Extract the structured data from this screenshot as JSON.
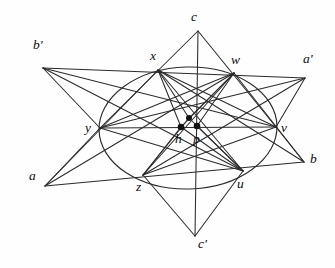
{
  "figure": {
    "background_color": "#fefefe",
    "stroke_color": "#2b2b2b",
    "width": 335,
    "height": 268
  },
  "labels": [
    {
      "id": "b-prime",
      "text": "b'",
      "x": 33,
      "y": 38,
      "kind": "outer-vertex"
    },
    {
      "id": "c",
      "text": "c",
      "x": 191,
      "y": 10,
      "kind": "outer-vertex"
    },
    {
      "id": "a-prime",
      "text": "a'",
      "x": 303,
      "y": 52,
      "kind": "outer-vertex"
    },
    {
      "id": "x",
      "text": "x",
      "x": 150,
      "y": 49,
      "kind": "conic-point"
    },
    {
      "id": "w",
      "text": "w",
      "x": 231,
      "y": 53,
      "kind": "conic-point"
    },
    {
      "id": "y",
      "text": "y",
      "x": 85,
      "y": 121,
      "kind": "conic-point"
    },
    {
      "id": "v",
      "text": "v",
      "x": 281,
      "y": 121,
      "kind": "conic-point"
    },
    {
      "id": "h",
      "text": "h",
      "x": 175,
      "y": 132,
      "kind": "center-point"
    },
    {
      "id": "p",
      "text": "p",
      "x": 193,
      "y": 132,
      "kind": "center-point"
    },
    {
      "id": "a",
      "text": "a",
      "x": 29,
      "y": 169,
      "kind": "outer-vertex"
    },
    {
      "id": "b",
      "text": "b",
      "x": 310,
      "y": 152,
      "kind": "outer-vertex"
    },
    {
      "id": "z",
      "text": "z",
      "x": 136,
      "y": 180,
      "kind": "conic-point"
    },
    {
      "id": "u",
      "text": "u",
      "x": 237,
      "y": 177,
      "kind": "conic-point"
    },
    {
      "id": "c-prime",
      "text": "c'",
      "x": 198,
      "y": 237,
      "kind": "outer-vertex"
    }
  ],
  "points": {
    "b_prime": {
      "x": 43,
      "y": 68
    },
    "c": {
      "x": 198,
      "y": 31
    },
    "a_prime": {
      "x": 305,
      "y": 78
    },
    "x": {
      "x": 158,
      "y": 70
    },
    "w": {
      "x": 234,
      "y": 73
    },
    "y": {
      "x": 100,
      "y": 128
    },
    "v": {
      "x": 276,
      "y": 127
    },
    "h": {
      "x": 181,
      "y": 127
    },
    "p": {
      "x": 197,
      "y": 126
    },
    "hub": {
      "x": 189,
      "y": 118
    },
    "a": {
      "x": 45,
      "y": 186
    },
    "b": {
      "x": 304,
      "y": 162
    },
    "z": {
      "x": 143,
      "y": 175
    },
    "u": {
      "x": 243,
      "y": 171
    },
    "c_prime": {
      "x": 195,
      "y": 236
    }
  },
  "conic": {
    "type": "ellipse",
    "cx": 188,
    "cy": 128,
    "rx": 89,
    "ry": 61,
    "rotation": -1.5
  },
  "dots": [
    {
      "id": "dot-h",
      "x": 181,
      "y": 127,
      "r": 3.3
    },
    {
      "id": "dot-p",
      "x": 197,
      "y": 126,
      "r": 3.3
    },
    {
      "id": "dot-hub",
      "x": 189,
      "y": 118,
      "r": 3.0
    }
  ],
  "segments": [
    {
      "id": "bprime-aprime",
      "from": "b_prime",
      "to": "a_prime"
    },
    {
      "id": "bprime-y",
      "from": "b_prime",
      "to": "y"
    },
    {
      "id": "bprime-u",
      "from": "b_prime",
      "to": "u"
    },
    {
      "id": "bprime-v",
      "from": "b_prime",
      "to": "v"
    },
    {
      "id": "aprime-v",
      "from": "a_prime",
      "to": "v"
    },
    {
      "id": "aprime-z",
      "from": "a_prime",
      "to": "z"
    },
    {
      "id": "aprime-y",
      "from": "a_prime",
      "to": "y"
    },
    {
      "id": "c-y",
      "from": "c",
      "to": "y"
    },
    {
      "id": "c-cprime",
      "from": "c",
      "to": "c_prime"
    },
    {
      "id": "c-v",
      "from": "c",
      "to": "v"
    },
    {
      "id": "a-b",
      "from": "a",
      "to": "b"
    },
    {
      "id": "a-x",
      "from": "a",
      "to": "x"
    },
    {
      "id": "a-w",
      "from": "a",
      "to": "w"
    },
    {
      "id": "a-y",
      "from": "a",
      "to": "y"
    },
    {
      "id": "b-w",
      "from": "b",
      "to": "w"
    },
    {
      "id": "b-x",
      "from": "b",
      "to": "x"
    },
    {
      "id": "b-v",
      "from": "b",
      "to": "v"
    },
    {
      "id": "cprime-z",
      "from": "c_prime",
      "to": "z"
    },
    {
      "id": "cprime-u",
      "from": "c_prime",
      "to": "u"
    },
    {
      "id": "yv-axis",
      "from": "y",
      "to": "v"
    },
    {
      "id": "x-hub",
      "from": "x",
      "to": "hub"
    },
    {
      "id": "w-hub",
      "from": "w",
      "to": "hub"
    },
    {
      "id": "z-hub",
      "from": "z",
      "to": "hub"
    },
    {
      "id": "u-hub",
      "from": "u",
      "to": "hub"
    },
    {
      "id": "x-u",
      "from": "x",
      "to": "u"
    },
    {
      "id": "w-z",
      "from": "w",
      "to": "z"
    },
    {
      "id": "y-w",
      "from": "y",
      "to": "w"
    },
    {
      "id": "x-v",
      "from": "x",
      "to": "v"
    },
    {
      "id": "y-u",
      "from": "y",
      "to": "u"
    },
    {
      "id": "z-v",
      "from": "z",
      "to": "v"
    },
    {
      "id": "h-x",
      "from": "h",
      "to": "x"
    },
    {
      "id": "h-w",
      "from": "h",
      "to": "w"
    },
    {
      "id": "h-z",
      "from": "h",
      "to": "z"
    },
    {
      "id": "h-u",
      "from": "h",
      "to": "u"
    },
    {
      "id": "p-u",
      "from": "p",
      "to": "u"
    },
    {
      "id": "p-w",
      "from": "p",
      "to": "w"
    }
  ]
}
